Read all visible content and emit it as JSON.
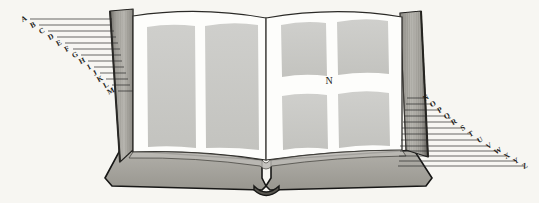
{
  "figure": {
    "name": "open-book-engraving",
    "background_color": "#f7f6f2",
    "ink_color": "#2a2a28",
    "paper_color": "#fdfdfb",
    "text_block_color": "#c9c9c6",
    "cover_color": "#9c9a94",
    "edge_color": "#8e8c86"
  },
  "center_label": {
    "text": "N",
    "x": 329,
    "y": 84
  },
  "left_labels": [
    {
      "text": "A",
      "lx": 25,
      "ly": 21,
      "x1": 30,
      "y1": 19,
      "x2": 112,
      "y2": 19
    },
    {
      "text": "B",
      "lx": 34,
      "ly": 27,
      "x1": 39,
      "y1": 25,
      "x2": 112,
      "y2": 25
    },
    {
      "text": "C",
      "lx": 43,
      "ly": 33,
      "x1": 48,
      "y1": 31,
      "x2": 114,
      "y2": 31
    },
    {
      "text": "D",
      "lx": 52,
      "ly": 39,
      "x1": 57,
      "y1": 37,
      "x2": 116,
      "y2": 37
    },
    {
      "text": "E",
      "lx": 60,
      "ly": 45,
      "x1": 65,
      "y1": 43,
      "x2": 118,
      "y2": 43
    },
    {
      "text": "F",
      "lx": 68,
      "ly": 51,
      "x1": 73,
      "y1": 49,
      "x2": 120,
      "y2": 49
    },
    {
      "text": "G",
      "lx": 76,
      "ly": 57,
      "x1": 81,
      "y1": 55,
      "x2": 121,
      "y2": 55
    },
    {
      "text": "H",
      "lx": 83,
      "ly": 63,
      "x1": 88,
      "y1": 61,
      "x2": 122,
      "y2": 61
    },
    {
      "text": "I",
      "lx": 90,
      "ly": 69,
      "x1": 94,
      "y1": 67,
      "x2": 124,
      "y2": 67
    },
    {
      "text": "J",
      "lx": 96,
      "ly": 75,
      "x1": 100,
      "y1": 73,
      "x2": 126,
      "y2": 73
    },
    {
      "text": "K",
      "lx": 101,
      "ly": 81,
      "x1": 106,
      "y1": 79,
      "x2": 128,
      "y2": 79
    },
    {
      "text": "L",
      "lx": 107,
      "ly": 87,
      "x1": 112,
      "y1": 85,
      "x2": 130,
      "y2": 85
    },
    {
      "text": "M",
      "lx": 112,
      "ly": 93,
      "x1": 118,
      "y1": 91,
      "x2": 133,
      "y2": 91
    }
  ],
  "right_labels": [
    {
      "text": "O",
      "lx": 434,
      "ly": 106,
      "x1": 406,
      "y1": 104,
      "x2": 432,
      "y2": 104
    },
    {
      "text": "P",
      "lx": 441,
      "ly": 112,
      "x1": 405,
      "y1": 110,
      "x2": 439,
      "y2": 110
    },
    {
      "text": "Q",
      "lx": 448,
      "ly": 118,
      "x1": 404,
      "y1": 116,
      "x2": 446,
      "y2": 116
    },
    {
      "text": "R",
      "lx": 455,
      "ly": 124,
      "x1": 403,
      "y1": 122,
      "x2": 453,
      "y2": 122
    },
    {
      "text": "S",
      "lx": 464,
      "ly": 130,
      "x1": 402,
      "y1": 128,
      "x2": 462,
      "y2": 128
    },
    {
      "text": "T",
      "lx": 472,
      "ly": 136,
      "x1": 402,
      "y1": 134,
      "x2": 470,
      "y2": 134
    },
    {
      "text": "U",
      "lx": 481,
      "ly": 142,
      "x1": 401,
      "y1": 140,
      "x2": 479,
      "y2": 140
    },
    {
      "text": "V",
      "lx": 490,
      "ly": 148,
      "x1": 400,
      "y1": 146,
      "x2": 488,
      "y2": 146
    },
    {
      "text": "W",
      "lx": 499,
      "ly": 153,
      "x1": 400,
      "y1": 151,
      "x2": 497,
      "y2": 151
    },
    {
      "text": "X",
      "lx": 508,
      "ly": 158,
      "x1": 399,
      "y1": 156,
      "x2": 506,
      "y2": 156
    },
    {
      "text": "Y",
      "lx": 517,
      "ly": 163,
      "x1": 399,
      "y1": 161,
      "x2": 515,
      "y2": 161
    },
    {
      "text": "Z",
      "lx": 526,
      "ly": 168,
      "x1": 398,
      "y1": 166,
      "x2": 524,
      "y2": 166
    }
  ],
  "right_top_label": {
    "text": "N",
    "lx": 427,
    "ly": 100,
    "x1": 407,
    "y1": 98,
    "x2": 425,
    "y2": 98
  },
  "text_blocks": {
    "left_page": [
      {
        "name": "left-page-column-1"
      },
      {
        "name": "left-page-column-2"
      }
    ],
    "right_page": [
      {
        "name": "right-page-block-top-left"
      },
      {
        "name": "right-page-block-top-right"
      },
      {
        "name": "right-page-block-bottom-left"
      },
      {
        "name": "right-page-block-bottom-right"
      }
    ]
  }
}
